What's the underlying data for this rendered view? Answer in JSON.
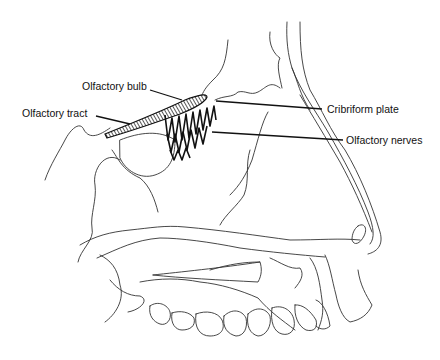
{
  "figure": {
    "labels": [
      {
        "id": "olfactory-bulb",
        "text": "Olfactory bulb"
      },
      {
        "id": "olfactory-tract",
        "text": "Olfactory tract"
      },
      {
        "id": "cribriform-plate",
        "text": "Cribriform plate"
      },
      {
        "id": "olfactory-nerves",
        "text": "Olfactory nerves"
      }
    ]
  },
  "colors": {
    "background": "#ffffff",
    "line": "#333333",
    "text": "#111111"
  }
}
